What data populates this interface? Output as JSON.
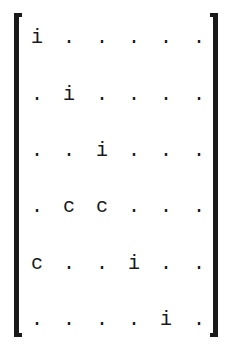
{
  "matrix": {
    "size": 6,
    "rows": [
      [
        "i",
        ".",
        ".",
        ".",
        ".",
        "."
      ],
      [
        ".",
        "i",
        ".",
        ".",
        ".",
        "."
      ],
      [
        ".",
        ".",
        "i",
        ".",
        ".",
        "."
      ],
      [
        ".",
        "c",
        "c",
        ".",
        ".",
        "."
      ],
      [
        "c",
        ".",
        ".",
        "i",
        ".",
        "."
      ],
      [
        ".",
        ".",
        ".",
        ".",
        "i",
        "."
      ]
    ]
  },
  "layout": {
    "col_x": [
      37,
      69,
      102,
      134,
      166,
      199
    ],
    "row_y": [
      40,
      97,
      153,
      209,
      266,
      322
    ]
  },
  "colors": {
    "ink": "#1a1a1a",
    "background": "#ffffff"
  }
}
